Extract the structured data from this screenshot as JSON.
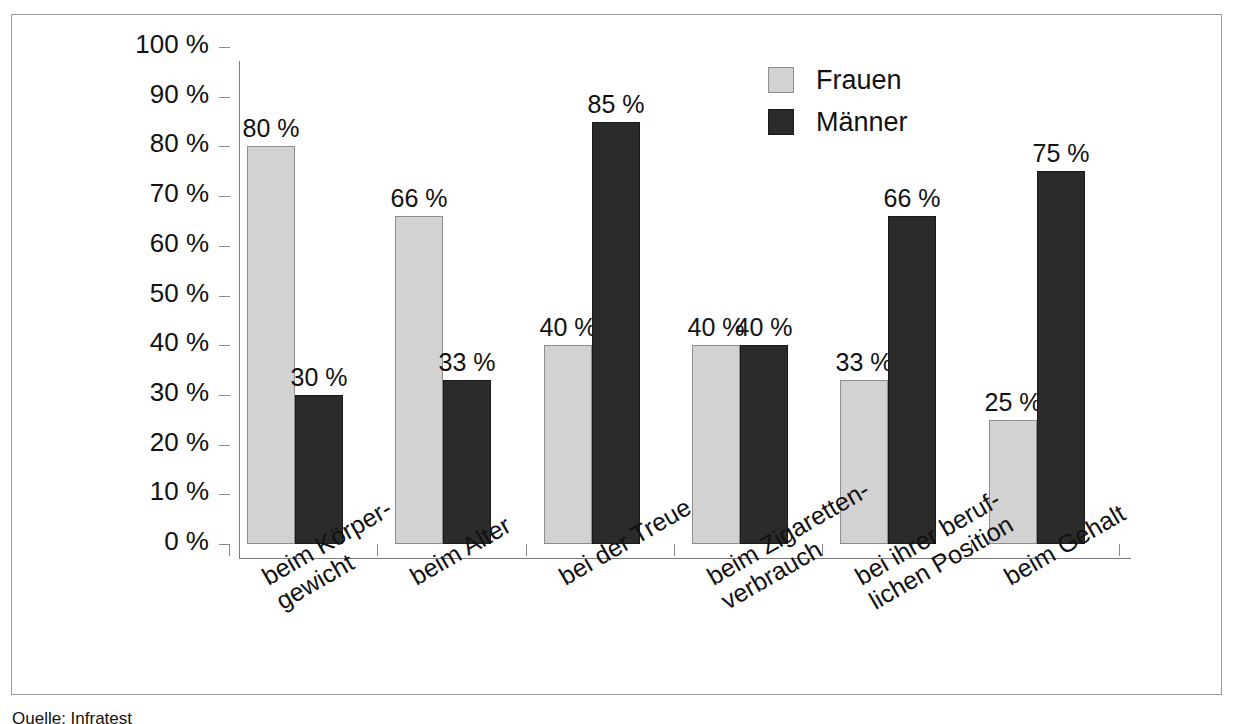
{
  "chart_data": {
    "type": "bar",
    "title": "",
    "xlabel": "",
    "ylabel": "",
    "ylim": [
      0,
      100
    ],
    "grid": false,
    "legend_position": "top-right",
    "categories": [
      "beim Körper-\ngewicht",
      "beim Alter",
      "bei der Treue",
      "beim Zigaretten-\nverbrauch",
      "bei ihrer beruf-\nlichen Position",
      "beim Gehalt"
    ],
    "category_lines": [
      [
        "beim Körper-",
        "gewicht"
      ],
      [
        "beim Alter"
      ],
      [
        "bei der Treue"
      ],
      [
        "beim Zigaretten-",
        "verbrauch"
      ],
      [
        "bei ihrer beruf-",
        "lichen Position"
      ],
      [
        "beim Gehalt"
      ]
    ],
    "series": [
      {
        "name": "Frauen",
        "color": "#d2d2d2",
        "values": [
          80,
          66,
          40,
          40,
          33,
          25
        ],
        "labels": [
          "80 %",
          "66 %",
          "40 %",
          "40 %",
          "33 %",
          "25 %"
        ]
      },
      {
        "name": "Männer",
        "color": "#2b2b2b",
        "values": [
          30,
          33,
          85,
          40,
          66,
          75
        ],
        "labels": [
          "30 %",
          "33 %",
          "85 %",
          "40 %",
          "66 %",
          "75 %"
        ]
      }
    ],
    "y_ticks": [
      0,
      10,
      20,
      30,
      40,
      50,
      60,
      70,
      80,
      90,
      100
    ],
    "y_tick_labels": [
      "0 %",
      "10 %",
      "20 %",
      "30 %",
      "40 %",
      "50 %",
      "60 %",
      "70 %",
      "80 %",
      "90 %",
      "100 %"
    ]
  },
  "legend": {
    "items": [
      {
        "label": "Frauen",
        "swatch": "light-gray"
      },
      {
        "label": "Männer",
        "swatch": "dark-gray"
      }
    ]
  },
  "caption": {
    "text": "Quelle: Infratest"
  }
}
